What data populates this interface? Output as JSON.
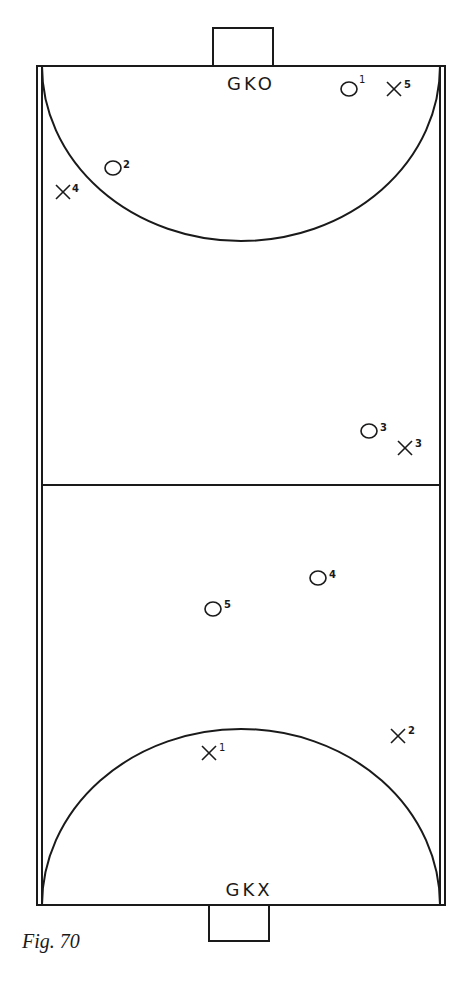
{
  "figure": {
    "caption": "Fig. 70",
    "colors": {
      "ink": "#1a1a1a",
      "background": "#ffffff"
    }
  },
  "court": {
    "goalkeepers": {
      "top": "GKO",
      "bottom": "GKX"
    }
  },
  "players": {
    "o1": {
      "symbol": "O",
      "number": "1"
    },
    "o2": {
      "symbol": "O",
      "number": "2"
    },
    "o3": {
      "symbol": "O",
      "number": "3"
    },
    "o4": {
      "symbol": "O",
      "number": "4"
    },
    "o5": {
      "symbol": "O",
      "number": "5"
    },
    "x1": {
      "symbol": "X",
      "number": "1"
    },
    "x2": {
      "symbol": "X",
      "number": "2"
    },
    "x3": {
      "symbol": "X",
      "number": "3"
    },
    "x4": {
      "symbol": "X",
      "number": "4"
    },
    "x5": {
      "symbol": "X",
      "number": "5"
    }
  }
}
